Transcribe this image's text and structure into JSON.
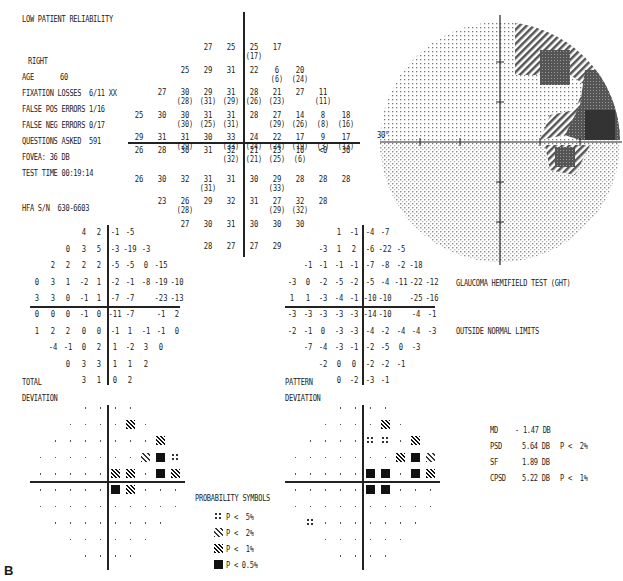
{
  "header": {
    "reliability": "LOW PATIENT RELIABILITY",
    "eye": "RIGHT",
    "age_label": "AGE",
    "age_value": "60",
    "fixation_label": "FIXATION LOSSES",
    "fixation_value": "6/11 XX",
    "fp_label": "FALSE POS ERRORS",
    "fp_value": "1/16",
    "fn_label": "FALSE NEG ERRORS",
    "fn_value": "0/17",
    "questions_label": "QUESTIONS ASKED",
    "questions_value": "591",
    "fovea": "FOVEA: 36 DB",
    "test_time": "TEST TIME 00:19:14",
    "hfa_sn": "HFA S/N  630-6603"
  },
  "threshold_grid": {
    "cells": [
      {
        "c": -2,
        "r": 4,
        "v": "27"
      },
      {
        "c": -1,
        "r": 4,
        "v": "25"
      },
      {
        "c": 0,
        "r": 4,
        "v": "25",
        "p": "(17)"
      },
      {
        "c": 1,
        "r": 4,
        "v": "17"
      },
      {
        "c": -3,
        "r": 3,
        "v": "25"
      },
      {
        "c": -2,
        "r": 3,
        "v": "29"
      },
      {
        "c": -1,
        "r": 3,
        "v": "31"
      },
      {
        "c": 0,
        "r": 3,
        "v": "22"
      },
      {
        "c": 1,
        "r": 3,
        "v": "6",
        "p": "(6)"
      },
      {
        "c": 2,
        "r": 3,
        "v": "20",
        "p": "(24)"
      },
      {
        "c": -4,
        "r": 2,
        "v": "27"
      },
      {
        "c": -3,
        "r": 2,
        "v": "30",
        "p": "(28)"
      },
      {
        "c": -2,
        "r": 2,
        "v": "29",
        "p": "(31)"
      },
      {
        "c": -1,
        "r": 2,
        "v": "31",
        "p": "(29)"
      },
      {
        "c": 0,
        "r": 2,
        "v": "28",
        "p": "(26)"
      },
      {
        "c": 1,
        "r": 2,
        "v": "21",
        "p": "(23)"
      },
      {
        "c": 2,
        "r": 2,
        "v": "27"
      },
      {
        "c": 3,
        "r": 2,
        "v": "11",
        "p": "(11)"
      },
      {
        "c": -5,
        "r": 1,
        "v": "25"
      },
      {
        "c": -4,
        "r": 1,
        "v": "30"
      },
      {
        "c": -3,
        "r": 1,
        "v": "30",
        "p": "(30)"
      },
      {
        "c": -2,
        "r": 1,
        "v": "31",
        "p": "(25)"
      },
      {
        "c": -1,
        "r": 1,
        "v": "31",
        "p": "(31)"
      },
      {
        "c": 0,
        "r": 1,
        "v": "28"
      },
      {
        "c": 1,
        "r": 1,
        "v": "27",
        "p": "(29)"
      },
      {
        "c": 2,
        "r": 1,
        "v": "14",
        "p": "(26)"
      },
      {
        "c": 3,
        "r": 1,
        "v": "8",
        "p": "(8)"
      },
      {
        "c": 4,
        "r": 1,
        "v": "18",
        "p": "(16)"
      },
      {
        "c": -5,
        "r": 0,
        "v": "29"
      },
      {
        "c": -4,
        "r": 0,
        "v": "31"
      },
      {
        "c": -3,
        "r": 0,
        "v": "31",
        "p": "(29)"
      },
      {
        "c": -2,
        "r": 0,
        "v": "30"
      },
      {
        "c": -1,
        "r": 0,
        "v": "33",
        "p": "(33)"
      },
      {
        "c": 0,
        "r": 0,
        "v": "24",
        "p": "(24)"
      },
      {
        "c": 1,
        "r": 0,
        "v": "22",
        "p": "(24)"
      },
      {
        "c": 2,
        "r": 0,
        "v": "17",
        "p": "(19)"
      },
      {
        "c": 3,
        "r": 0,
        "v": "9",
        "p": "(3)"
      },
      {
        "c": 4,
        "r": 0,
        "v": "17",
        "p": "(13)"
      },
      {
        "c": -5,
        "r": -1,
        "v": "26"
      },
      {
        "c": -4,
        "r": -1,
        "v": "28"
      },
      {
        "c": -3,
        "r": -1,
        "v": "30"
      },
      {
        "c": -2,
        "r": -1,
        "v": "31"
      },
      {
        "c": -1,
        "r": -1,
        "v": "32",
        "p": "(32)"
      },
      {
        "c": 0,
        "r": -1,
        "v": "21",
        "p": "(21)"
      },
      {
        "c": 1,
        "r": -1,
        "v": "23",
        "p": "(25)"
      },
      {
        "c": 2,
        "r": -1,
        "v": "10",
        "p": "(6)"
      },
      {
        "c": 3,
        "r": -1,
        "v": "<0"
      },
      {
        "c": 4,
        "r": -1,
        "v": "30"
      },
      {
        "c": -5,
        "r": -2,
        "v": "26"
      },
      {
        "c": -4,
        "r": -2,
        "v": "30"
      },
      {
        "c": -3,
        "r": -2,
        "v": "32"
      },
      {
        "c": -2,
        "r": -2,
        "v": "31",
        "p": "(31)"
      },
      {
        "c": -1,
        "r": -2,
        "v": "31"
      },
      {
        "c": 0,
        "r": -2,
        "v": "30"
      },
      {
        "c": 1,
        "r": -2,
        "v": "29",
        "p": "(33)"
      },
      {
        "c": 2,
        "r": -2,
        "v": "28"
      },
      {
        "c": 3,
        "r": -2,
        "v": "28"
      },
      {
        "c": 4,
        "r": -2,
        "v": "28"
      },
      {
        "c": -4,
        "r": -3,
        "v": "23"
      },
      {
        "c": -3,
        "r": -3,
        "v": "26",
        "p": "(28)"
      },
      {
        "c": -2,
        "r": -3,
        "v": "29"
      },
      {
        "c": -1,
        "r": -3,
        "v": "32"
      },
      {
        "c": 0,
        "r": -3,
        "v": "31"
      },
      {
        "c": 1,
        "r": -3,
        "v": "27",
        "p": "(29)"
      },
      {
        "c": 2,
        "r": -3,
        "v": "32",
        "p": "(32)"
      },
      {
        "c": 3,
        "r": -3,
        "v": "28"
      },
      {
        "c": -3,
        "r": -4,
        "v": "27"
      },
      {
        "c": -2,
        "r": -4,
        "v": "30"
      },
      {
        "c": -1,
        "r": -4,
        "v": "31"
      },
      {
        "c": 0,
        "r": -4,
        "v": "30"
      },
      {
        "c": 1,
        "r": -4,
        "v": "30"
      },
      {
        "c": 2,
        "r": -4,
        "v": "30"
      },
      {
        "c": -2,
        "r": -5,
        "v": "28"
      },
      {
        "c": -1,
        "r": -5,
        "v": "27"
      },
      {
        "c": 0,
        "r": -5,
        "v": "27"
      },
      {
        "c": 1,
        "r": -5,
        "v": "29"
      }
    ]
  },
  "greyscale": {
    "axis_label": "30°"
  },
  "total_deviation": {
    "label_total": "TOTAL",
    "label_deviation": "DEVIATION",
    "rows": [
      {
        "r": 4,
        "start": -2,
        "vals": [
          "4",
          "2",
          "-1",
          "-5"
        ]
      },
      {
        "r": 3,
        "start": -3,
        "vals": [
          "0",
          "3",
          "5",
          "-3",
          "-19",
          "-3"
        ]
      },
      {
        "r": 2,
        "start": -4,
        "vals": [
          "2",
          "2",
          "2",
          "2",
          "-5",
          "-5",
          "0",
          "-15"
        ]
      },
      {
        "r": 1,
        "start": -5,
        "vals": [
          "0",
          "3",
          "1",
          "-2",
          "1",
          "-2",
          "-1",
          "-8",
          "-19",
          "-10"
        ]
      },
      {
        "r": 0,
        "start": -5,
        "vals": [
          "3",
          "3",
          "0",
          "-1",
          "1",
          "-7",
          "-7",
          "",
          "-23",
          "-13"
        ]
      },
      {
        "r": -1,
        "start": -5,
        "vals": [
          "0",
          "0",
          "0",
          "-1",
          "0",
          "-11",
          "-7",
          "",
          "-1",
          "2"
        ]
      },
      {
        "r": -2,
        "start": -5,
        "vals": [
          "1",
          "2",
          "2",
          "0",
          "0",
          "-1",
          "1",
          "-1",
          "-1",
          "0"
        ]
      },
      {
        "r": -3,
        "start": -4,
        "vals": [
          "-4",
          "-1",
          "0",
          "2",
          "1",
          "-2",
          "3",
          "0"
        ]
      },
      {
        "r": -4,
        "start": -3,
        "vals": [
          "0",
          "3",
          "3",
          "1",
          "1",
          "2"
        ]
      },
      {
        "r": -5,
        "start": -2,
        "vals": [
          "3",
          "1",
          "0",
          "2"
        ]
      }
    ]
  },
  "pattern_deviation": {
    "label_pattern": "PATTERN",
    "label_deviation": "DEVIATION",
    "rows": [
      {
        "r": 4,
        "start": -2,
        "vals": [
          "1",
          "-1",
          "-4",
          "-7"
        ]
      },
      {
        "r": 3,
        "start": -3,
        "vals": [
          "-3",
          "1",
          "2",
          "-6",
          "-22",
          "-5"
        ]
      },
      {
        "r": 2,
        "start": -4,
        "vals": [
          "-1",
          "-1",
          "-1",
          "-1",
          "-7",
          "-8",
          "-2",
          "-18"
        ]
      },
      {
        "r": 1,
        "start": -5,
        "vals": [
          "-3",
          "0",
          "-2",
          "-5",
          "-2",
          "-5",
          "-4",
          "-11",
          "-22",
          "-12"
        ]
      },
      {
        "r": 0,
        "start": -5,
        "vals": [
          "1",
          "1",
          "-3",
          "-4",
          "-1",
          "-10",
          "-10",
          "",
          "-25",
          "-16"
        ]
      },
      {
        "r": -1,
        "start": -5,
        "vals": [
          "-3",
          "-3",
          "-3",
          "-3",
          "-3",
          "-14",
          "-10",
          "",
          "-4",
          "-1"
        ]
      },
      {
        "r": -2,
        "start": -5,
        "vals": [
          "-2",
          "-1",
          "0",
          "-3",
          "-3",
          "-4",
          "-2",
          "-4",
          "-4",
          "-3"
        ]
      },
      {
        "r": -3,
        "start": -4,
        "vals": [
          "-7",
          "-4",
          "-3",
          "-1",
          "-2",
          "-5",
          "0",
          "-3"
        ]
      },
      {
        "r": -4,
        "start": -3,
        "vals": [
          "-2",
          "0",
          "0",
          "-2",
          "-2",
          "-1"
        ]
      },
      {
        "r": -5,
        "start": -2,
        "vals": [
          "0",
          "-2",
          "-3",
          "-1"
        ]
      }
    ]
  },
  "total_prob": {
    "symbols": [
      {
        "c": 1,
        "r": 3,
        "s": "s1"
      },
      {
        "c": 3,
        "r": 2,
        "s": "s1"
      },
      {
        "c": 2,
        "r": 1,
        "s": "s2"
      },
      {
        "c": 3,
        "r": 1,
        "s": "s05"
      },
      {
        "c": 4,
        "r": 1,
        "s": "s5"
      },
      {
        "c": 0,
        "r": 0,
        "s": "s1"
      },
      {
        "c": 1,
        "r": 0,
        "s": "s1"
      },
      {
        "c": 3,
        "r": 0,
        "s": "s05"
      },
      {
        "c": 4,
        "r": 0,
        "s": "s1"
      },
      {
        "c": 0,
        "r": -1,
        "s": "s05"
      },
      {
        "c": 1,
        "r": -1,
        "s": "s1"
      }
    ]
  },
  "pattern_prob": {
    "symbols": [
      {
        "c": 1,
        "r": 3,
        "s": "s1"
      },
      {
        "c": 0,
        "r": 2,
        "s": "s5"
      },
      {
        "c": 1,
        "r": 2,
        "s": "s5"
      },
      {
        "c": 3,
        "r": 2,
        "s": "s1"
      },
      {
        "c": 2,
        "r": 1,
        "s": "s1"
      },
      {
        "c": 3,
        "r": 1,
        "s": "s05"
      },
      {
        "c": 4,
        "r": 1,
        "s": "s2"
      },
      {
        "c": 0,
        "r": 0,
        "s": "s05"
      },
      {
        "c": 1,
        "r": 0,
        "s": "s05"
      },
      {
        "c": 3,
        "r": 0,
        "s": "s05"
      },
      {
        "c": 4,
        "r": 0,
        "s": "s1"
      },
      {
        "c": 0,
        "r": -1,
        "s": "s05"
      },
      {
        "c": 1,
        "r": -1,
        "s": "s05"
      },
      {
        "c": -4,
        "r": -3,
        "s": "s5"
      }
    ]
  },
  "legend": {
    "title": "PROBABILITY SYMBOLS",
    "items": [
      {
        "s": "s5",
        "label": "P <  5%"
      },
      {
        "s": "s2",
        "label": "P <  2%"
      },
      {
        "s": "s1",
        "label": "P <  1%"
      },
      {
        "s": "s05",
        "label": "P < 0.5%"
      }
    ]
  },
  "ght": {
    "title": "GLAUCOMA HEMIFIELD TEST (GHT)",
    "result": "OUTSIDE NORMAL LIMITS"
  },
  "global_indices": {
    "md_label": "MD",
    "md_value": "- 1.47 DB",
    "psd_label": "PSD",
    "psd_value": "5.64 DB",
    "psd_p": "P <  2%",
    "sf_label": "SF",
    "sf_value": "1.89 DB",
    "cpsd_label": "CPSD",
    "cpsd_value": "5.22 DB",
    "cpsd_p": "P <  1%"
  },
  "figure_label": "B"
}
